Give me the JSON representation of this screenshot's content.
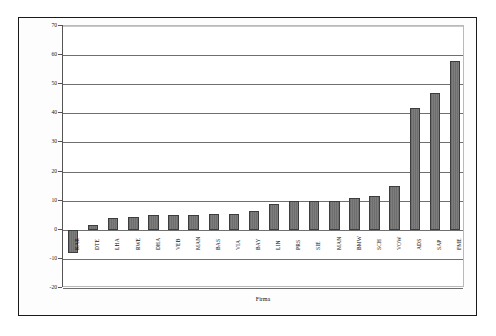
{
  "figure": {
    "background_color": "#ffffff",
    "frame_color": "#1a1a1a",
    "bar_color": "#757575",
    "bar_edge_color": "#3d3d3d",
    "grid_color": "#6f6f6f"
  },
  "chart_data": {
    "type": "bar",
    "title": "",
    "xlabel": "Firma",
    "ylabel": "Umsatzwachstum (in %) seit 3 Jahren durchschnittlich) 1990",
    "ylim": [
      -20,
      70
    ],
    "yticks": [
      -20,
      -10,
      0,
      10,
      20,
      30,
      40,
      50,
      60,
      70
    ],
    "ytick_labels": [
      "-20",
      "-10",
      "0",
      "10",
      "20",
      "30",
      "40",
      "50",
      "60",
      "70"
    ],
    "grid": true,
    "grid_axis": "y",
    "legend": null,
    "categories": [
      "KAR",
      "DTE",
      "LHA",
      "RWE",
      "DHA",
      "VEB",
      "MAN",
      "BAS",
      "VIA",
      "BAY",
      "LIN",
      "PRS",
      "SIE",
      "MAN",
      "BMW",
      "SCH",
      "VOW",
      "ADS",
      "SAP",
      "FME"
    ],
    "values": [
      -8,
      1.5,
      4,
      4.5,
      5,
      5,
      5,
      5.5,
      5.5,
      6.5,
      9,
      10,
      10,
      10,
      11,
      11.5,
      15,
      42,
      47,
      58
    ],
    "series": [
      {
        "name": "Umsatzwachstum",
        "values": [
          -8,
          1.5,
          4,
          4.5,
          5,
          5,
          5,
          5.5,
          5.5,
          6.5,
          9,
          10,
          10,
          10,
          11,
          11.5,
          15,
          42,
          47,
          58
        ]
      }
    ]
  }
}
